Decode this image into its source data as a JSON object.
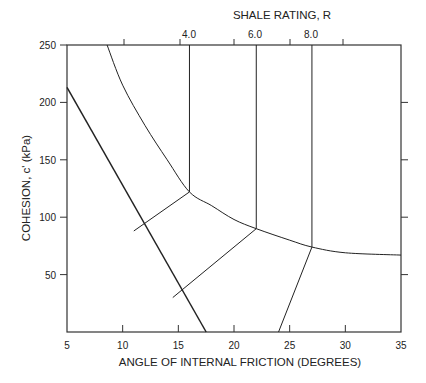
{
  "chart_data": {
    "type": "line",
    "title": "SHALE RATING, R",
    "xlabel": "ANGLE OF INTERNAL FRICTION  (DEGREES)",
    "ylabel": "COHESION, c' (kPa)",
    "xlim": [
      5,
      35
    ],
    "ylim": [
      0,
      250
    ],
    "x_ticks": [
      "5",
      "10",
      "15",
      "20",
      "25",
      "30",
      "35"
    ],
    "y_ticks": [
      "50",
      "100",
      "150",
      "200",
      "250"
    ],
    "top_axis_label": "SHALE RATING, R",
    "top_ticks": [
      "4.0",
      "6.0",
      "8.0"
    ],
    "grid": false,
    "series": [
      {
        "name": "boundary line (diagonal)",
        "points": [
          [
            5,
            213
          ],
          [
            17.5,
            0
          ]
        ]
      },
      {
        "name": "envelope curve",
        "points": [
          [
            8.6,
            250
          ],
          [
            10,
            215
          ],
          [
            12,
            180
          ],
          [
            14,
            150
          ],
          [
            16,
            122
          ],
          [
            18,
            110
          ],
          [
            20,
            98
          ],
          [
            22,
            90
          ],
          [
            25,
            80
          ],
          [
            27,
            74
          ],
          [
            30,
            69
          ],
          [
            35,
            67
          ]
        ]
      },
      {
        "name": "R=4.0 vertical",
        "points": [
          [
            16,
            250
          ],
          [
            16,
            122
          ]
        ]
      },
      {
        "name": "R=6.0 vertical",
        "points": [
          [
            22,
            250
          ],
          [
            22,
            90
          ]
        ]
      },
      {
        "name": "R=8.0 vertical",
        "points": [
          [
            27,
            250
          ],
          [
            27,
            74
          ]
        ]
      },
      {
        "name": "connector 4.0",
        "points": [
          [
            16,
            122
          ],
          [
            11,
            88
          ]
        ]
      },
      {
        "name": "connector 6.0",
        "points": [
          [
            22,
            90
          ],
          [
            14.5,
            30
          ]
        ]
      },
      {
        "name": "connector 8.0",
        "points": [
          [
            27,
            74
          ],
          [
            24,
            0
          ]
        ]
      }
    ]
  }
}
